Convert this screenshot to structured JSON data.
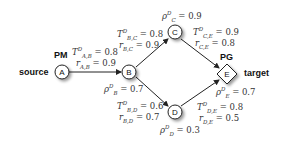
{
  "diagram": {
    "source_label": "source",
    "target_label": "target",
    "pm_label": "PM",
    "pg_label": "PG",
    "nodes": {
      "A": {
        "label": "A",
        "shape": "circle"
      },
      "B": {
        "label": "B",
        "shape": "circle"
      },
      "C": {
        "label": "C",
        "shape": "circle"
      },
      "D": {
        "label": "D",
        "shape": "circle"
      },
      "E": {
        "label": "E",
        "shape": "diamond"
      }
    },
    "edges": {
      "AB": {
        "T_sym": "T",
        "T_sub": "A,B",
        "T_sup": "D",
        "T_val": "= 0.8",
        "r_sym": "r",
        "r_sub": "A,B",
        "r_val": "= 0.9"
      },
      "BC": {
        "T_sym": "T",
        "T_sub": "B,C",
        "T_sup": "D",
        "T_val": "= 0.8",
        "r_sym": "r",
        "r_sub": "B,C",
        "r_val": "= 0.9"
      },
      "BD": {
        "T_sym": "T",
        "T_sub": "B,D",
        "T_sup": "D",
        "T_val": "= 0.6",
        "r_sym": "r",
        "r_sub": "B,D",
        "r_val": "= 0.7"
      },
      "CE": {
        "T_sym": "T",
        "T_sub": "C,E",
        "T_sup": "D",
        "T_val": "= 0.9",
        "r_sym": "r",
        "r_sub": "C,E",
        "r_val": "= 0.8"
      },
      "DE": {
        "T_sym": "T",
        "T_sub": "D,E",
        "T_sup": "D",
        "T_val": "= 0.8",
        "r_sym": "r",
        "r_sub": "D,E",
        "r_val": "= 0.5"
      }
    },
    "rho": {
      "B": {
        "sym": "ρ",
        "sub": "B",
        "sup": "D",
        "val": "= 0.7"
      },
      "C": {
        "sym": "ρ",
        "sub": "C",
        "sup": "D",
        "val": "= 0.9"
      },
      "D": {
        "sym": "ρ",
        "sub": "D",
        "sup": "D",
        "val": "= 0.3"
      },
      "E": {
        "sym": "ρ",
        "sub": "E",
        "sup": "D",
        "val": "= 0.7"
      }
    },
    "colors": {
      "stroke": "#222222",
      "node_fill": "#ffffff",
      "shadow": "#bbbbbb"
    }
  }
}
